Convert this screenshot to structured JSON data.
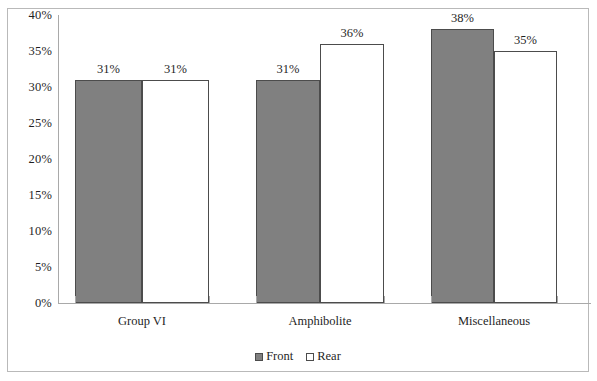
{
  "chart_data": {
    "type": "bar",
    "title": "",
    "subtitle": "",
    "xlabel": "",
    "ylabel": "",
    "categories": [
      "Group VI",
      "Amphibolite",
      "Miscellaneous"
    ],
    "series": [
      {
        "name": "Front",
        "color": "#808080",
        "values": [
          31,
          31,
          38
        ],
        "value_labels": [
          "31%",
          "31%",
          "38%"
        ]
      },
      {
        "name": "Rear",
        "color": "#ffffff",
        "values": [
          31,
          36,
          35
        ],
        "value_labels": [
          "31%",
          "36%",
          "35%"
        ]
      }
    ],
    "ylim": [
      0,
      40
    ],
    "ytick_values": [
      0,
      5,
      10,
      15,
      20,
      25,
      30,
      35,
      40
    ],
    "ytick_labels": [
      "0%",
      "5%",
      "10%",
      "15%",
      "20%",
      "25%",
      "30%",
      "35%",
      "40%"
    ],
    "grid": false,
    "legend_position": "bottom",
    "bar_outline_color": "#4c4c4c",
    "axis_color": "#a9a9a9",
    "frame_color": "#b9b9b9",
    "background": "#ffffff"
  },
  "legend": {
    "items": [
      {
        "label": "Front",
        "swatch": "legend-swatch-front"
      },
      {
        "label": "Rear",
        "swatch": "legend-swatch-rear"
      }
    ]
  }
}
